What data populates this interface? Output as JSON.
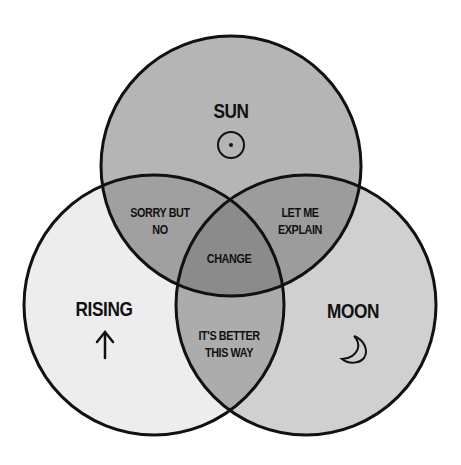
{
  "diagram": {
    "type": "venn-3",
    "colors": {
      "background": "#ffffff",
      "sun_only": "#b5b5b5",
      "rising_only": "#ededed",
      "moon_only": "#d0d0d0",
      "sun_rising": "#a0a0a0",
      "sun_moon": "#9c9c9c",
      "rising_moon": "#acacac",
      "center": "#8b8b8b",
      "stroke": "#111111"
    },
    "sets": [
      {
        "id": "sun",
        "label": "SUN",
        "icon": "sun-symbol-icon"
      },
      {
        "id": "rising",
        "label": "RISING",
        "icon": "up-arrow-icon",
        "icon_glyph": "↑"
      },
      {
        "id": "moon",
        "label": "MOON",
        "icon": "crescent-moon-icon"
      }
    ],
    "intersections": {
      "sun_rising": [
        "SORRY BUT",
        "NO"
      ],
      "sun_moon": [
        "LET ME",
        "EXPLAIN"
      ],
      "rising_moon": [
        "IT'S BETTER",
        "THIS WAY"
      ],
      "center": "CHANGE"
    }
  }
}
